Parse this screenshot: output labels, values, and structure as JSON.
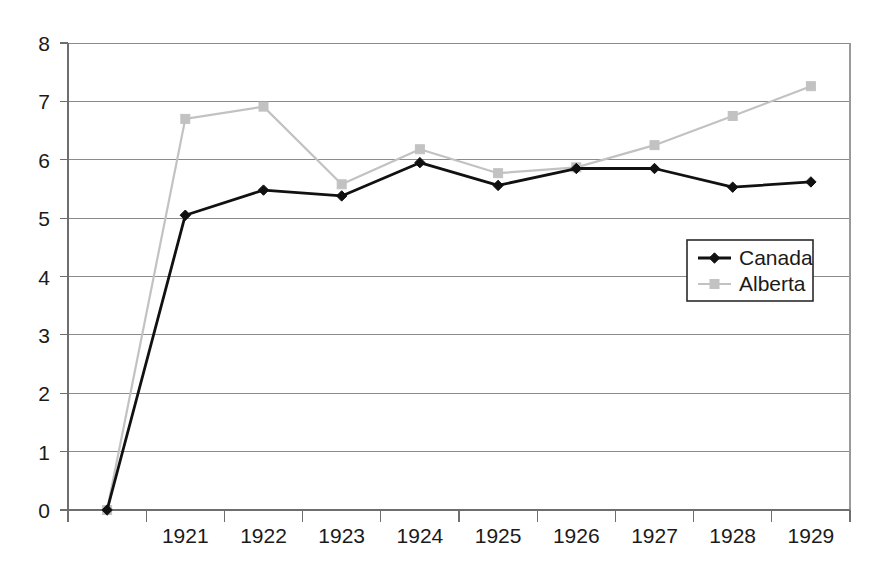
{
  "chart_data": {
    "type": "line",
    "title": "",
    "subtitle": "",
    "xlabel": "",
    "ylabel": "",
    "categories": [
      "",
      "1921",
      "1922",
      "1923",
      "1924",
      "1925",
      "1926",
      "1927",
      "1928",
      "1929"
    ],
    "x_tick_labels": [
      "1921",
      "1922",
      "1923",
      "1924",
      "1925",
      "1926",
      "1927",
      "1928",
      "1929"
    ],
    "y_tick_labels": [
      "0",
      "1",
      "2",
      "3",
      "4",
      "5",
      "6",
      "7",
      "8"
    ],
    "ylim": [
      0,
      8
    ],
    "y_major_step": 1,
    "grid": "horizontal",
    "legend_position": "inside-right",
    "series": [
      {
        "name": "Canada",
        "color": "#111111",
        "marker": "diamond",
        "values": [
          0.0,
          5.05,
          5.48,
          5.38,
          5.95,
          5.56,
          5.85,
          5.85,
          5.53,
          5.62
        ]
      },
      {
        "name": "Alberta",
        "color": "#c2c2c2",
        "marker": "square",
        "values": [
          0.0,
          6.7,
          6.91,
          5.58,
          6.18,
          5.77,
          5.87,
          6.25,
          6.75,
          7.26
        ]
      }
    ],
    "legend": [
      {
        "label": "Canada",
        "color": "#111111",
        "marker": "diamond"
      },
      {
        "label": "Alberta",
        "color": "#c2c2c2",
        "marker": "square"
      }
    ]
  },
  "colors": {
    "canada": "#111111",
    "alberta": "#c2c2c2",
    "grid": "#8a8a8a",
    "axis": "#6e6e6e",
    "background": "#ffffff",
    "text": "#1a1a1a"
  }
}
